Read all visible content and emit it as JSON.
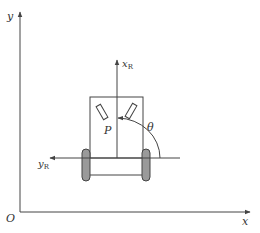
{
  "diagram": {
    "global_frame": {
      "origin_label": "O",
      "x_axis_label": "x",
      "y_axis_label": "y"
    },
    "robot_frame": {
      "x_axis_label": "x",
      "x_axis_subscript": "R",
      "y_axis_label": "y",
      "y_axis_subscript": "R",
      "point_label": "P",
      "angle_label": "θ"
    },
    "colors": {
      "line": "#444444",
      "wheel_fill": "#9a9a9a",
      "text": "#333333"
    }
  }
}
